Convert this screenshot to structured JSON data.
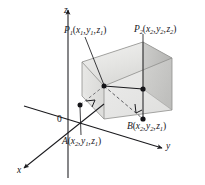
{
  "figure": {
    "type": "3d-coordinate-diagram",
    "axes": {
      "x_label": "x",
      "y_label": "y",
      "z_label": "z",
      "origin_label": "0"
    },
    "points": [
      {
        "id": "P1",
        "name": "P",
        "index": "1",
        "coords": [
          "x",
          "1",
          "y",
          "1",
          "z",
          "1"
        ],
        "label_text": "P1(x1, y1, z1)"
      },
      {
        "id": "P2",
        "name": "P",
        "index": "2",
        "coords": [
          "x",
          "2",
          "y",
          "2",
          "z",
          "2"
        ],
        "label_text": "P2(x2, y2, z2)"
      },
      {
        "id": "A",
        "name": "A",
        "index": "",
        "coords": [
          "x",
          "2",
          "y",
          "1",
          "z",
          "1"
        ],
        "label_text": "A(x2, y1, z1)"
      },
      {
        "id": "B",
        "name": "B",
        "index": "",
        "coords": [
          "x",
          "2",
          "y",
          "2",
          "z",
          "1"
        ],
        "label_text": "B(x2, y2, z1)"
      }
    ],
    "colors": {
      "line": "#1a1a1e",
      "box_fill_light": "#e2e2e0",
      "box_fill_mid": "#d2d2d0",
      "box_fill_dark": "#bcbcba",
      "box_edge": "#9a9a98",
      "dot": "#141418",
      "background": "#ffffff"
    }
  }
}
